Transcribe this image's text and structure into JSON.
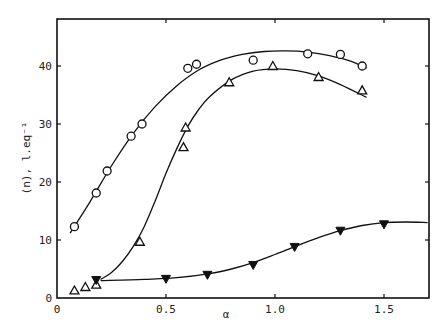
{
  "chart_data": {
    "type": "scatter",
    "title": "",
    "xlabel": "α",
    "ylabel": "(n), l.eq⁻¹",
    "xlim": [
      0,
      1.7
    ],
    "ylim": [
      0,
      47
    ],
    "grid": false,
    "legend": null,
    "x_ticks": [
      {
        "value": 0,
        "label": "0"
      },
      {
        "value": 0.5,
        "label": "0.5"
      },
      {
        "value": 1.0,
        "label": "1.0"
      },
      {
        "value": 1.5,
        "label": "1.5"
      }
    ],
    "y_ticks": [
      {
        "value": 0,
        "label": "0"
      },
      {
        "value": 10,
        "label": "10"
      },
      {
        "value": 20,
        "label": "20"
      },
      {
        "value": 30,
        "label": "30"
      },
      {
        "value": 40,
        "label": "40"
      }
    ],
    "series": [
      {
        "name": "open circles",
        "marker": "circle-open",
        "points": [
          [
            0.08,
            12.3
          ],
          [
            0.18,
            18.1
          ],
          [
            0.23,
            21.9
          ],
          [
            0.34,
            27.9
          ],
          [
            0.39,
            30.0
          ],
          [
            0.6,
            39.6
          ],
          [
            0.64,
            40.3
          ],
          [
            0.9,
            41.0
          ],
          [
            1.15,
            42.1
          ],
          [
            1.3,
            42.0
          ],
          [
            1.4,
            40.0
          ]
        ],
        "curve": [
          [
            0.06,
            11.2
          ],
          [
            0.15,
            16.5
          ],
          [
            0.25,
            22.8
          ],
          [
            0.35,
            28.4
          ],
          [
            0.45,
            33.0
          ],
          [
            0.55,
            36.6
          ],
          [
            0.65,
            39.3
          ],
          [
            0.75,
            41.0
          ],
          [
            0.85,
            42.0
          ],
          [
            0.95,
            42.5
          ],
          [
            1.05,
            42.6
          ],
          [
            1.15,
            42.4
          ],
          [
            1.25,
            41.8
          ],
          [
            1.35,
            40.8
          ],
          [
            1.42,
            39.6
          ]
        ]
      },
      {
        "name": "open triangles",
        "marker": "triangle-open",
        "points": [
          [
            0.08,
            1.3
          ],
          [
            0.13,
            1.9
          ],
          [
            0.18,
            2.3
          ],
          [
            0.38,
            9.7
          ],
          [
            0.58,
            26.0
          ],
          [
            0.59,
            29.4
          ],
          [
            0.79,
            37.2
          ],
          [
            0.99,
            40.0
          ],
          [
            1.2,
            38.1
          ],
          [
            1.4,
            35.8
          ]
        ],
        "curve": [
          [
            0.2,
            3.2
          ],
          [
            0.25,
            4.4
          ],
          [
            0.3,
            6.3
          ],
          [
            0.35,
            8.9
          ],
          [
            0.4,
            12.3
          ],
          [
            0.45,
            16.7
          ],
          [
            0.5,
            21.5
          ],
          [
            0.55,
            25.8
          ],
          [
            0.6,
            29.6
          ],
          [
            0.65,
            32.5
          ],
          [
            0.7,
            34.7
          ],
          [
            0.8,
            37.6
          ],
          [
            0.9,
            39.1
          ],
          [
            1.0,
            39.5
          ],
          [
            1.1,
            39.2
          ],
          [
            1.2,
            38.3
          ],
          [
            1.3,
            36.8
          ],
          [
            1.42,
            34.6
          ]
        ]
      },
      {
        "name": "filled inverted triangles",
        "marker": "triangle-down-filled",
        "points": [
          [
            0.18,
            3.1
          ],
          [
            0.5,
            3.3
          ],
          [
            0.69,
            4.0
          ],
          [
            0.9,
            5.7
          ],
          [
            1.09,
            8.8
          ],
          [
            1.3,
            11.6
          ],
          [
            1.5,
            12.7
          ]
        ],
        "curve": [
          [
            0.2,
            3.0
          ],
          [
            0.4,
            3.2
          ],
          [
            0.55,
            3.5
          ],
          [
            0.7,
            4.2
          ],
          [
            0.8,
            5.0
          ],
          [
            0.9,
            6.1
          ],
          [
            1.0,
            7.5
          ],
          [
            1.1,
            9.0
          ],
          [
            1.2,
            10.4
          ],
          [
            1.3,
            11.6
          ],
          [
            1.4,
            12.5
          ],
          [
            1.5,
            13.0
          ],
          [
            1.6,
            13.1
          ],
          [
            1.7,
            13.0
          ]
        ]
      }
    ]
  }
}
